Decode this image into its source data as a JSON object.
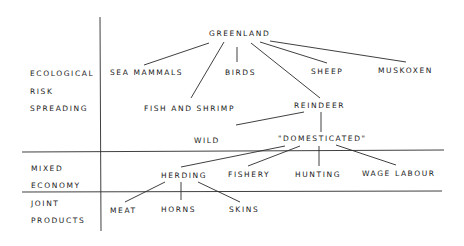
{
  "diagram": {
    "categories": {
      "ecological": [
        "ECOLOGICAL",
        "RISK",
        "SPREADING"
      ],
      "mixed": [
        "MIXED",
        "ECONOMY"
      ],
      "joint": [
        "JOINT",
        "PRODUCTS"
      ]
    },
    "nodes": {
      "greenland": "GREENLAND",
      "sea_mammals": "SEA MAMMALS",
      "birds": "BIRDS",
      "sheep": "SHEEP",
      "muskoxen": "MUSKOXEN",
      "fish_and_shrimp": "FISH AND SHRIMP",
      "reindeer": "REINDEER",
      "wild": "WILD",
      "domesticated": "\"DOMESTICATED\"",
      "herding": "HERDING",
      "fishery": "FISHERY",
      "hunting": "HUNTING",
      "wage_labour": "WAGE LABOUR",
      "meat": "MEAT",
      "horns": "HORNS",
      "skins": "SKINS"
    },
    "edges": [
      [
        "greenland",
        "sea_mammals"
      ],
      [
        "greenland",
        "fish_and_shrimp"
      ],
      [
        "greenland",
        "birds"
      ],
      [
        "greenland",
        "reindeer"
      ],
      [
        "greenland",
        "sheep"
      ],
      [
        "greenland",
        "muskoxen"
      ],
      [
        "reindeer",
        "wild"
      ],
      [
        "reindeer",
        "domesticated"
      ],
      [
        "domesticated",
        "herding"
      ],
      [
        "domesticated",
        "fishery"
      ],
      [
        "domesticated",
        "hunting"
      ],
      [
        "domesticated",
        "wage_labour"
      ],
      [
        "herding",
        "meat"
      ],
      [
        "herding",
        "horns"
      ],
      [
        "herding",
        "skins"
      ]
    ],
    "line_color": "#2a2a2a"
  }
}
